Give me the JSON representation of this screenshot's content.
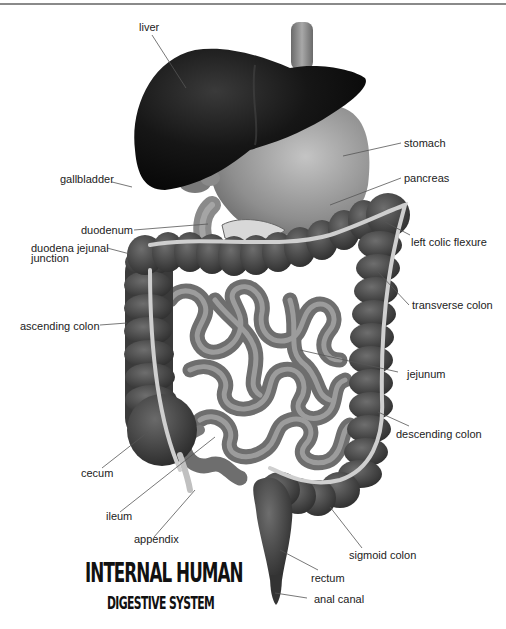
{
  "diagram": {
    "title_line1": "INTERNAL HUMAN",
    "title_line2": "DIGESTIVE SYSTEM",
    "labels": {
      "liver": "liver",
      "stomach": "stomach",
      "gallbladder": "gallbladder",
      "pancreas": "pancreas",
      "duodenum": "duodenum",
      "duodena_jejunal_junction_line1": "duodena jejunal",
      "duodena_jejunal_junction_line2": "junction",
      "left_colic_flexure": "left colic flexure",
      "transverse_colon": "transverse colon",
      "ascending_colon": "ascending colon",
      "jejunum": "jejunum",
      "descending_colon": "descending colon",
      "cecum": "cecum",
      "ileum": "ileum",
      "appendix": "appendix",
      "sigmoid_colon": "sigmoid colon",
      "rectum": "rectum",
      "anal_canal": "anal canal"
    },
    "colors": {
      "liver": "#1a1a1a",
      "stomach": "#9a9a9a",
      "colon": "#4a4a4a",
      "small_intestine": "#8c8c8c",
      "taenia_band": "#c8c8c8",
      "leader_line": "#555555"
    }
  }
}
